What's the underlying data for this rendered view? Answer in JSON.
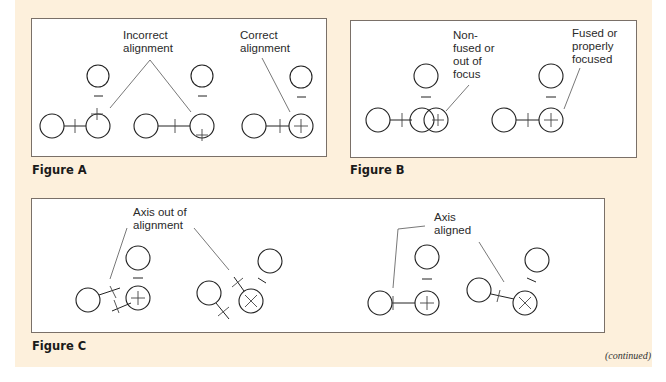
{
  "figures": {
    "a": {
      "label": "Figure A",
      "notes": {
        "incorrect": [
          "Incorrect",
          "alignment"
        ],
        "correct": [
          "Correct",
          "alignment"
        ]
      }
    },
    "b": {
      "label": "Figure B",
      "notes": {
        "nonfused": [
          "Non-",
          "fused or",
          "out of",
          "focus"
        ],
        "fused": [
          "Fused or",
          "properly",
          "focused"
        ]
      }
    },
    "c": {
      "label": "Figure C",
      "notes": {
        "out": [
          "Axis out of",
          "alignment"
        ],
        "aligned": [
          "Axis",
          "aligned"
        ]
      }
    }
  },
  "footer": {
    "continued": "(continued)"
  },
  "colors": {
    "page_background": "#fdf0dc",
    "box_border": "#7a7068"
  }
}
